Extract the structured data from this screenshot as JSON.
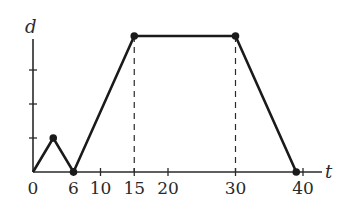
{
  "chart_data": {
    "type": "line",
    "title": "",
    "xlabel": "t",
    "ylabel": "d",
    "x": [
      0,
      3,
      6,
      15,
      30,
      39
    ],
    "values": [
      0,
      1,
      0,
      4,
      4,
      0
    ],
    "series": [
      {
        "name": "d(t)",
        "x": [
          0,
          3,
          6,
          15,
          30,
          39
        ],
        "y": [
          0,
          1,
          0,
          4,
          4,
          0
        ]
      }
    ],
    "x_ticks": [
      0,
      6,
      10,
      15,
      20,
      30,
      40
    ],
    "x_tick_labels": [
      "0",
      "6",
      "10",
      "15",
      "20",
      "30",
      "40"
    ],
    "y_ticks": [
      1,
      2,
      3
    ],
    "y_tick_labels": [],
    "dashed_guides_at_t": [
      15,
      30
    ],
    "marked_points": [
      [
        3,
        1
      ],
      [
        6,
        0
      ],
      [
        15,
        4
      ],
      [
        30,
        4
      ],
      [
        39,
        0
      ]
    ],
    "xlim": [
      0,
      43
    ],
    "ylim": [
      0,
      4.2
    ],
    "grid": false,
    "legend": "none",
    "colors": {
      "line": "#1a1a1a",
      "axis": "#2a2a2a",
      "background": "#ffffff"
    }
  },
  "labels": {
    "x_axis": "t",
    "y_axis": "d",
    "ticks": [
      "0",
      "6",
      "10",
      "15",
      "20",
      "30",
      "40"
    ]
  }
}
